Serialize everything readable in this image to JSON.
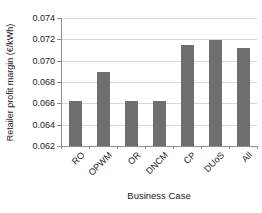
{
  "chart_data": {
    "type": "bar",
    "categories": [
      "RO",
      "OPWM",
      "OR",
      "DNCM",
      "CP",
      "DUoS",
      "All"
    ],
    "values": [
      0.0662,
      0.0689,
      0.0662,
      0.0662,
      0.0715,
      0.0719,
      0.0712
    ],
    "title": "",
    "xlabel": "Business Case",
    "ylabel": "Retailer profit margin (€/kWh)",
    "ylim": [
      0.062,
      0.074
    ],
    "ytick_step": 0.002,
    "yticks": [
      "0.062",
      "0.064",
      "0.066",
      "0.068",
      "0.070",
      "0.072",
      "0.074"
    ],
    "grid": true,
    "legend_position": "none",
    "colors": {
      "bar": "#6f6f6f",
      "gridline": "#d8d8d8",
      "axis": "#8e8e8e",
      "text": "#1c1c1c",
      "background": "#ffffff"
    }
  }
}
